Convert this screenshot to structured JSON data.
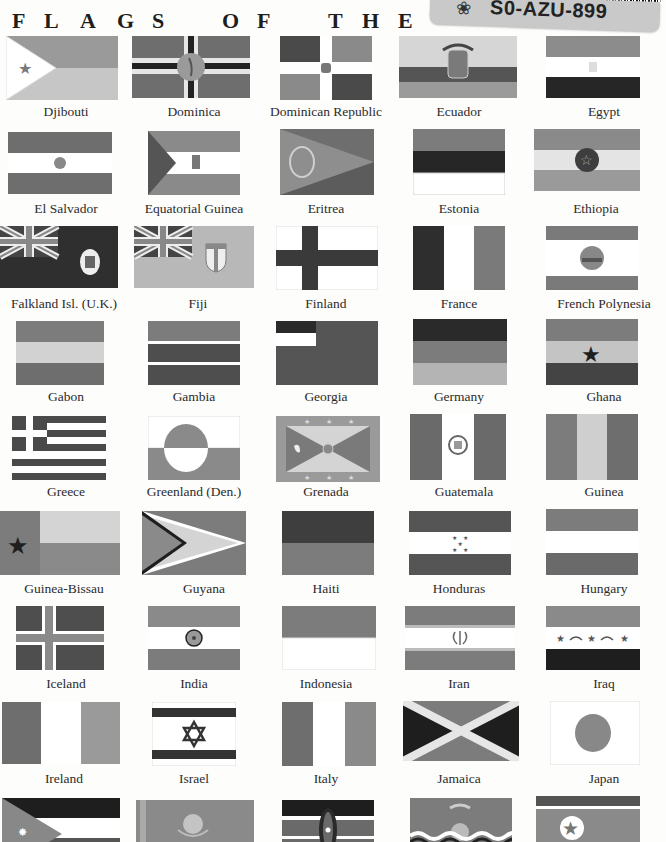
{
  "page": {
    "heading_letters": [
      "F",
      "L",
      "A",
      "G",
      "S",
      "O",
      "F",
      "T",
      "H",
      "E",
      "W",
      "O",
      "R"
    ],
    "sticker_code": "S0-AZU-899"
  },
  "flags": [
    {
      "name": "Djibouti"
    },
    {
      "name": "Dominica"
    },
    {
      "name": "Dominican Republic"
    },
    {
      "name": "Ecuador"
    },
    {
      "name": "Egypt"
    },
    {
      "name": "El Salvador"
    },
    {
      "name": "Equatorial Guinea"
    },
    {
      "name": "Eritrea"
    },
    {
      "name": "Estonia"
    },
    {
      "name": "Ethiopia"
    },
    {
      "name": "Falkland Isl. (U.K.)"
    },
    {
      "name": "Fiji"
    },
    {
      "name": "Finland"
    },
    {
      "name": "France"
    },
    {
      "name": "French Polynesia"
    },
    {
      "name": "Gabon"
    },
    {
      "name": "Gambia"
    },
    {
      "name": "Georgia"
    },
    {
      "name": "Germany"
    },
    {
      "name": "Ghana"
    },
    {
      "name": "Greece"
    },
    {
      "name": "Greenland (Den.)"
    },
    {
      "name": "Grenada"
    },
    {
      "name": "Guatemala"
    },
    {
      "name": "Guinea"
    },
    {
      "name": "Guinea-Bissau"
    },
    {
      "name": "Guyana"
    },
    {
      "name": "Haiti"
    },
    {
      "name": "Honduras"
    },
    {
      "name": "Hungary"
    },
    {
      "name": "Iceland"
    },
    {
      "name": "India"
    },
    {
      "name": "Indonesia"
    },
    {
      "name": "Iran"
    },
    {
      "name": "Iraq"
    },
    {
      "name": "Ireland"
    },
    {
      "name": "Israel"
    },
    {
      "name": "Italy"
    },
    {
      "name": "Jamaica"
    },
    {
      "name": "Japan"
    },
    {
      "name": "Jordan"
    },
    {
      "name": "Kazakhstan"
    },
    {
      "name": "Kenya"
    },
    {
      "name": "Kiribati"
    },
    {
      "name": "North Korea"
    }
  ],
  "colors": {
    "paper": "#fdfdfc",
    "dark": "#2e2e2e",
    "mid": "#6e6e6e",
    "light": "#a8a8a8",
    "pale": "#d2d2d2",
    "white": "#ffffff"
  }
}
